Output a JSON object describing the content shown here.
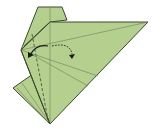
{
  "diagram": {
    "type": "origami-fold-step",
    "colors": {
      "paper": "#b5cf8f",
      "paper_dark": "#a6c27e",
      "edge": "#3c4a2c",
      "crease": "#6f7f5a",
      "arrow": "#1a1a1a"
    },
    "arrows": [
      {
        "name": "valley-fold-arrow",
        "style": "solid",
        "direction": "left"
      },
      {
        "name": "unfold-arrow",
        "style": "dotted",
        "direction": "right"
      }
    ],
    "fold_lines": [
      {
        "name": "dashed-valley-line",
        "style": "dashed"
      }
    ]
  }
}
